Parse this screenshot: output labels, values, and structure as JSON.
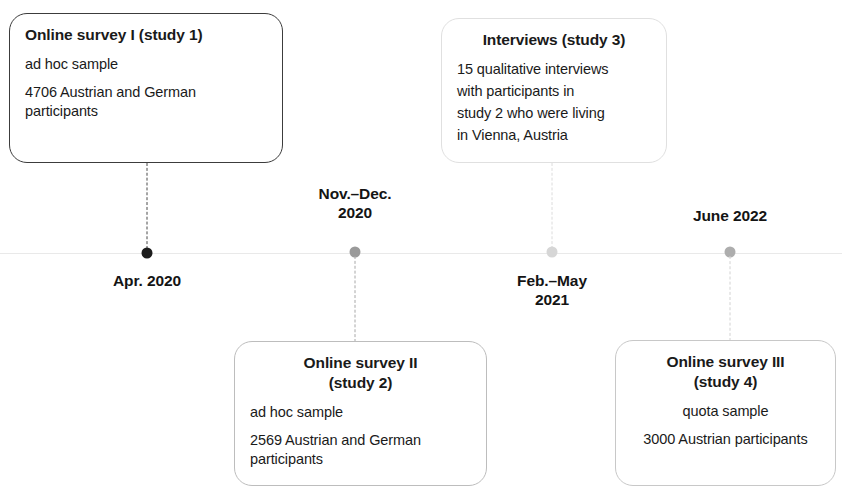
{
  "figure": {
    "type": "timeline-diagram",
    "axis": {
      "y": 253,
      "color": "#e9e9e9"
    }
  },
  "events": [
    {
      "id": "study-1",
      "date_label": "Apr. 2020",
      "date_position": "below",
      "marker_x": 147,
      "marker_color": "#1d1d1d",
      "connector_color": "#4a4a4a",
      "box_side": "above",
      "box": {
        "border_color": "#3c3c3c",
        "title": "Online survey I (study 1)",
        "title_align": "left",
        "body_align": "left",
        "lines": [
          "ad hoc sample",
          "4706 Austrian and German participants"
        ]
      }
    },
    {
      "id": "study-2",
      "date_label": "Nov.–Dec.\n2020",
      "date_position": "above",
      "marker_x": 355,
      "marker_color": "#9a9a9a",
      "connector_color": "#a8a8a8",
      "box_side": "below",
      "box": {
        "border_color": "#bdbdbd",
        "title": "Online survey II\n(study 2)",
        "title_align": "center",
        "body_align": "left",
        "lines": [
          "ad hoc sample",
          "2569 Austrian and German participants"
        ]
      }
    },
    {
      "id": "study-3",
      "date_label": "Feb.–May\n2021",
      "date_position": "below",
      "marker_x": 552,
      "marker_color": "#d6d6d6",
      "connector_color": "#dcdcdc",
      "box_side": "above",
      "box": {
        "border_color": "#e0e0e0",
        "title": "Interviews (study 3)",
        "title_align": "center",
        "body_align": "left",
        "lines": [
          "15 qualitative interviews",
          "with participants in",
          "study 2 who were living",
          "in Vienna, Austria"
        ]
      }
    },
    {
      "id": "study-4",
      "date_label": "June 2022",
      "date_position": "above",
      "marker_x": 730,
      "marker_color": "#adadad",
      "connector_color": "#d2d2d2",
      "box_side": "below",
      "box": {
        "border_color": "#c8c8c8",
        "title": "Online survey III\n(study 4)",
        "title_align": "center",
        "body_align": "center",
        "lines": [
          "quota sample",
          "3000 Austrian participants"
        ]
      }
    }
  ]
}
